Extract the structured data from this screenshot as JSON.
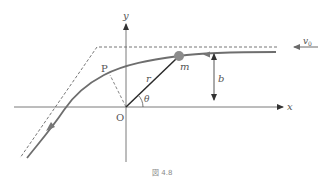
{
  "figure": {
    "caption": "図 4.8",
    "labels": {
      "x_axis": "x",
      "y_axis": "y",
      "origin": "O",
      "point_p": "P",
      "mass": "m",
      "radius": "r",
      "angle": "θ",
      "impact_parameter": "b",
      "initial_velocity": "v",
      "initial_velocity_sub": "0"
    },
    "colors": {
      "curve": "#6e6e6e",
      "axes": "#7a7a7a",
      "dashed": "#666666",
      "mass_fill": "#8c8c8c",
      "radius_line": "#2a2a2a"
    }
  }
}
